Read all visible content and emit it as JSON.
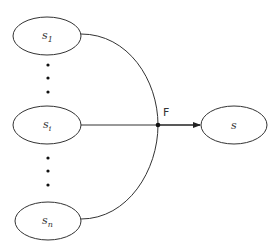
{
  "diagram": {
    "type": "fan-in",
    "nodes": [
      {
        "id": "s1",
        "base": "s",
        "sub": "1",
        "cx": 47,
        "cy": 36,
        "rx": 34,
        "ry": 19
      },
      {
        "id": "si",
        "base": "s",
        "sub": "i",
        "cx": 47,
        "cy": 125,
        "rx": 34,
        "ry": 19
      },
      {
        "id": "sn",
        "base": "s",
        "sub": "n",
        "cx": 48,
        "cy": 221,
        "rx": 33,
        "ry": 19
      },
      {
        "id": "s",
        "base": "s",
        "sub": "",
        "cx": 234,
        "cy": 125,
        "rx": 33,
        "ry": 19
      }
    ],
    "junction": {
      "label": "F",
      "x": 158,
      "y": 125
    },
    "ellipsis_groups": [
      {
        "between": [
          "s1",
          "si"
        ],
        "dots_y": [
          65,
          78,
          92
        ]
      },
      {
        "between": [
          "si",
          "sn"
        ],
        "dots_y": [
          158,
          171,
          185
        ]
      }
    ],
    "edges": [
      {
        "from": "s1",
        "to": "F",
        "style": "curve"
      },
      {
        "from": "si",
        "to": "F",
        "style": "straight"
      },
      {
        "from": "sn",
        "to": "F",
        "style": "curve"
      },
      {
        "from": "F",
        "to": "s",
        "style": "arrow"
      }
    ],
    "colors": {
      "stroke": "#333333",
      "background": "#ffffff"
    }
  }
}
